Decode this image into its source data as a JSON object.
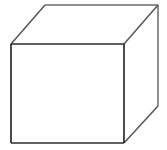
{
  "figure": {
    "kind": "line-drawing",
    "canvas": {
      "width": 167,
      "height": 150,
      "background_color": "#ffffff"
    },
    "style": {
      "front_edge_color": "#2b2b2b",
      "receding_edge_color": "#5a5a5a",
      "back_edge_color": "#6a6a6a",
      "front_edge_width": 1.7,
      "receding_edge_width": 1.6,
      "back_edge_width": 1.5,
      "fill_color": "#ffffff"
    },
    "vertices": {
      "front_top_left": {
        "label": "A",
        "x": 11,
        "y": 44
      },
      "front_top_right": {
        "label": "B",
        "x": 124,
        "y": 44
      },
      "front_bottom_right": {
        "label": "C",
        "x": 124,
        "y": 143
      },
      "front_bottom_left": {
        "label": "D",
        "x": 11,
        "y": 143
      },
      "back_top_left": {
        "label": "E",
        "x": 45,
        "y": 5
      },
      "back_top_right": {
        "label": "F",
        "x": 158,
        "y": 5
      },
      "back_bottom_right": {
        "label": "G",
        "x": 158,
        "y": 106
      }
    },
    "faces": [
      {
        "name": "front-face",
        "visible": true,
        "points": "11,44 124,44 124,143 11,143"
      },
      {
        "name": "top-face",
        "visible": true,
        "points": "11,44 45,5 158,5 124,44"
      },
      {
        "name": "right-face",
        "visible": true,
        "points": "124,44 158,5 158,106 124,143"
      }
    ],
    "edges": [
      {
        "name": "front-top-edge",
        "kind": "front",
        "x1": 11,
        "y1": 44,
        "x2": 124,
        "y2": 44
      },
      {
        "name": "front-right-edge",
        "kind": "front",
        "x1": 124,
        "y1": 44,
        "x2": 124,
        "y2": 143
      },
      {
        "name": "front-bottom-edge",
        "kind": "front",
        "x1": 124,
        "y1": 143,
        "x2": 11,
        "y2": 143
      },
      {
        "name": "front-left-edge",
        "kind": "front",
        "x1": 11,
        "y1": 143,
        "x2": 11,
        "y2": 44
      },
      {
        "name": "top-left-receding-edge",
        "kind": "receding",
        "x1": 11,
        "y1": 44,
        "x2": 45,
        "y2": 5
      },
      {
        "name": "top-right-receding-edge",
        "kind": "receding",
        "x1": 124,
        "y1": 44,
        "x2": 158,
        "y2": 5
      },
      {
        "name": "bottom-right-receding-edge",
        "kind": "receding",
        "x1": 124,
        "y1": 143,
        "x2": 158,
        "y2": 106
      },
      {
        "name": "back-top-edge",
        "kind": "back",
        "x1": 45,
        "y1": 5,
        "x2": 158,
        "y2": 5
      },
      {
        "name": "back-right-edge",
        "kind": "back",
        "x1": 158,
        "y1": 5,
        "x2": 158,
        "y2": 106
      }
    ],
    "hidden_edges": [],
    "labels": []
  }
}
